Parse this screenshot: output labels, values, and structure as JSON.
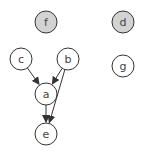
{
  "diagram": {
    "type": "directed-graph",
    "colors": {
      "stroke": "#333333",
      "default_fill": "#ffffff",
      "highlight_fill": "#d3d3d3",
      "text": "#444444"
    },
    "nodes": [
      {
        "id": "f",
        "label": "f",
        "cx": 46,
        "cy": 22,
        "highlighted": true
      },
      {
        "id": "d",
        "label": "d",
        "cx": 123,
        "cy": 22,
        "highlighted": true
      },
      {
        "id": "c",
        "label": "c",
        "cx": 21,
        "cy": 59,
        "highlighted": false
      },
      {
        "id": "b",
        "label": "b",
        "cx": 68,
        "cy": 59,
        "highlighted": false
      },
      {
        "id": "g",
        "label": "g",
        "cx": 123,
        "cy": 66,
        "highlighted": false
      },
      {
        "id": "a",
        "label": "a",
        "cx": 46,
        "cy": 94,
        "highlighted": false
      },
      {
        "id": "e",
        "label": "e",
        "cx": 46,
        "cy": 134,
        "highlighted": false
      }
    ],
    "edges": [
      {
        "from": "c",
        "to": "a"
      },
      {
        "from": "b",
        "to": "a"
      },
      {
        "from": "b",
        "to": "e"
      },
      {
        "from": "a",
        "to": "e"
      }
    ]
  }
}
